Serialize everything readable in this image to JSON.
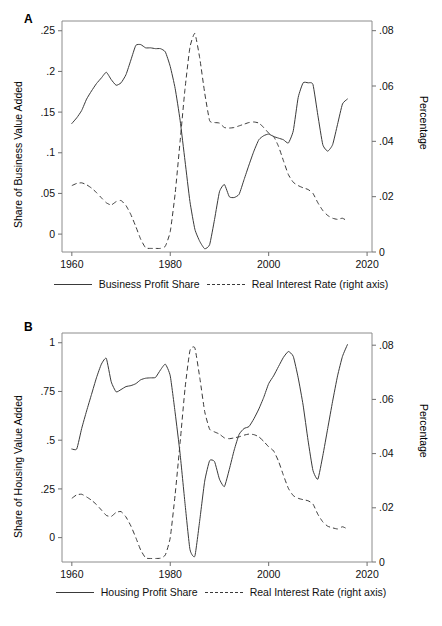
{
  "figure": {
    "caption": ""
  },
  "chart_data": [
    {
      "type": "line",
      "panel": "A",
      "panel_label": "A",
      "title": "",
      "xlabel": "",
      "ylabel": "Share of Business Value Added",
      "y2label": "Percentage",
      "xlim": [
        1958,
        2021
      ],
      "ylim": [
        -0.022,
        0.262
      ],
      "y2lim": [
        0.0,
        0.0835
      ],
      "xticks": [
        1960,
        1980,
        2000,
        2020
      ],
      "xticklabels": [
        "1960",
        "1980",
        "2000",
        "2020"
      ],
      "yticks": [
        0,
        0.05,
        0.1,
        0.15,
        0.2,
        0.25
      ],
      "yticklabels": [
        "0",
        ".05",
        ".1",
        ".15",
        ".2",
        ".25"
      ],
      "y2ticks": [
        0,
        0.02,
        0.04,
        0.06,
        0.08
      ],
      "y2ticklabels": [
        "0",
        ".02",
        ".04",
        ".06",
        ".08"
      ],
      "grid": false,
      "legend_position": "below",
      "series": [
        {
          "name": "Business Profit Share",
          "style": "solid",
          "axis": "left",
          "x": [
            1960,
            1961,
            1962,
            1963,
            1964,
            1965,
            1966,
            1967,
            1968,
            1969,
            1970,
            1971,
            1972,
            1973,
            1974,
            1975,
            1976,
            1977,
            1978,
            1979,
            1980,
            1981,
            1982,
            1983,
            1984,
            1985,
            1986,
            1987,
            1988,
            1989,
            1990,
            1991,
            1992,
            1993,
            1994,
            1995,
            1996,
            1997,
            1998,
            1999,
            2000,
            2001,
            2002,
            2003,
            2004,
            2005,
            2006,
            2007,
            2008,
            2009,
            2010,
            2011,
            2012,
            2013,
            2014,
            2015,
            2016
          ],
          "y": [
            0.136,
            0.143,
            0.152,
            0.166,
            0.176,
            0.185,
            0.192,
            0.199,
            0.19,
            0.183,
            0.186,
            0.196,
            0.214,
            0.232,
            0.233,
            0.229,
            0.229,
            0.228,
            0.228,
            0.224,
            0.206,
            0.179,
            0.14,
            0.09,
            0.04,
            0.006,
            -0.009,
            -0.018,
            -0.013,
            0.018,
            0.052,
            0.061,
            0.046,
            0.045,
            0.049,
            0.067,
            0.085,
            0.102,
            0.116,
            0.121,
            0.123,
            0.12,
            0.118,
            0.116,
            0.112,
            0.127,
            0.168,
            0.186,
            0.186,
            0.184,
            0.146,
            0.11,
            0.102,
            0.11,
            0.135,
            0.16,
            0.166
          ]
        },
        {
          "name": "Real Interest Rate (right axis)",
          "style": "dashed",
          "axis": "right",
          "x": [
            1960,
            1961,
            1962,
            1963,
            1964,
            1965,
            1966,
            1967,
            1968,
            1969,
            1970,
            1971,
            1972,
            1973,
            1974,
            1975,
            1976,
            1977,
            1978,
            1979,
            1980,
            1981,
            1982,
            1983,
            1984,
            1985,
            1986,
            1987,
            1988,
            1989,
            1990,
            1991,
            1992,
            1993,
            1994,
            1995,
            1996,
            1997,
            1998,
            1999,
            2000,
            2001,
            2002,
            2003,
            2004,
            2005,
            2006,
            2007,
            2008,
            2009,
            2010,
            2011,
            2012,
            2013,
            2014,
            2015,
            2016
          ],
          "y": [
            0.024,
            0.0248,
            0.025,
            0.0243,
            0.0231,
            0.0215,
            0.0196,
            0.0178,
            0.017,
            0.0182,
            0.0186,
            0.0168,
            0.0135,
            0.0092,
            0.0046,
            0.0015,
            0.0013,
            0.0013,
            0.0013,
            0.0021,
            0.0074,
            0.0212,
            0.04,
            0.059,
            0.074,
            0.079,
            0.07,
            0.0575,
            0.0475,
            0.0468,
            0.0466,
            0.045,
            0.0448,
            0.045,
            0.0456,
            0.0462,
            0.0468,
            0.047,
            0.0466,
            0.045,
            0.043,
            0.0418,
            0.0382,
            0.033,
            0.028,
            0.0252,
            0.024,
            0.0232,
            0.0226,
            0.0212,
            0.0178,
            0.015,
            0.0132,
            0.0122,
            0.0118,
            0.0122,
            0.0112
          ]
        }
      ]
    },
    {
      "type": "line",
      "panel": "B",
      "panel_label": "B",
      "title": "",
      "xlabel": "",
      "ylabel": "Share of Housing Value Added",
      "y2label": "Percentage",
      "xlim": [
        1958,
        2021
      ],
      "ylim": [
        -0.125,
        1.05
      ],
      "y2lim": [
        0.0,
        0.0845
      ],
      "xticks": [
        1960,
        1980,
        2000,
        2020
      ],
      "xticklabels": [
        "1960",
        "1980",
        "2000",
        "2020"
      ],
      "yticks": [
        0,
        0.25,
        0.5,
        0.75,
        1
      ],
      "yticklabels": [
        "0",
        ".25",
        ".5",
        ".75",
        "1"
      ],
      "y2ticks": [
        0,
        0.02,
        0.04,
        0.06,
        0.08
      ],
      "y2ticklabels": [
        "0",
        ".02",
        ".04",
        ".06",
        ".08"
      ],
      "grid": false,
      "legend_position": "below",
      "series": [
        {
          "name": "Housing Profit Share",
          "style": "solid",
          "axis": "left",
          "x": [
            1960,
            1961,
            1962,
            1963,
            1964,
            1965,
            1966,
            1967,
            1968,
            1969,
            1970,
            1971,
            1972,
            1973,
            1974,
            1975,
            1976,
            1977,
            1978,
            1979,
            1980,
            1981,
            1982,
            1983,
            1984,
            1985,
            1986,
            1987,
            1988,
            1989,
            1990,
            1991,
            1992,
            1993,
            1994,
            1995,
            1996,
            1997,
            1998,
            1999,
            2000,
            2001,
            2002,
            2003,
            2004,
            2005,
            2006,
            2007,
            2008,
            2009,
            2010,
            2011,
            2012,
            2013,
            2014,
            2015,
            2016
          ],
          "y": [
            0.455,
            0.455,
            0.56,
            0.65,
            0.735,
            0.82,
            0.89,
            0.92,
            0.8,
            0.748,
            0.76,
            0.775,
            0.78,
            0.79,
            0.81,
            0.818,
            0.82,
            0.822,
            0.86,
            0.89,
            0.83,
            0.64,
            0.43,
            0.175,
            -0.06,
            -0.095,
            0.09,
            0.29,
            0.395,
            0.39,
            0.3,
            0.262,
            0.35,
            0.45,
            0.53,
            0.56,
            0.57,
            0.61,
            0.66,
            0.72,
            0.79,
            0.83,
            0.878,
            0.925,
            0.955,
            0.93,
            0.82,
            0.68,
            0.5,
            0.345,
            0.3,
            0.42,
            0.56,
            0.7,
            0.83,
            0.93,
            0.99
          ]
        },
        {
          "name": "Real Interest Rate (right axis)",
          "style": "dashed",
          "axis": "right",
          "x": [
            1960,
            1961,
            1962,
            1963,
            1964,
            1965,
            1966,
            1967,
            1968,
            1969,
            1970,
            1971,
            1972,
            1973,
            1974,
            1975,
            1976,
            1977,
            1978,
            1979,
            1980,
            1981,
            1982,
            1983,
            1984,
            1985,
            1986,
            1987,
            1988,
            1989,
            1990,
            1991,
            1992,
            1993,
            1994,
            1995,
            1996,
            1997,
            1998,
            1999,
            2000,
            2001,
            2002,
            2003,
            2004,
            2005,
            2006,
            2007,
            2008,
            2009,
            2010,
            2011,
            2012,
            2013,
            2014,
            2015,
            2016
          ],
          "y": [
            0.0235,
            0.0248,
            0.025,
            0.024,
            0.0228,
            0.0212,
            0.0192,
            0.0172,
            0.0168,
            0.0183,
            0.0186,
            0.0166,
            0.0133,
            0.009,
            0.0044,
            0.0015,
            0.0013,
            0.0013,
            0.0014,
            0.0026,
            0.009,
            0.025,
            0.044,
            0.064,
            0.078,
            0.079,
            0.068,
            0.0555,
            0.049,
            0.048,
            0.0472,
            0.0458,
            0.0455,
            0.0458,
            0.0462,
            0.0468,
            0.0472,
            0.047,
            0.0462,
            0.0445,
            0.0425,
            0.041,
            0.0372,
            0.032,
            0.0272,
            0.0245,
            0.0235,
            0.023,
            0.0226,
            0.0214,
            0.0176,
            0.0148,
            0.0132,
            0.0126,
            0.0122,
            0.013,
            0.0122
          ]
        }
      ]
    }
  ],
  "panel_a": {
    "letter": "A",
    "ylabel": "Share of Business Value Added",
    "y2label": "Percentage",
    "legend": {
      "solid_label": "Business Profit Share",
      "dashed_label": "Real Interest Rate (right axis)"
    }
  },
  "panel_b": {
    "letter": "B",
    "ylabel": "Share of Housing Value Added",
    "y2label": "Percentage",
    "legend": {
      "solid_label": "Housing Profit Share",
      "dashed_label": "Real Interest Rate (right axis)"
    }
  }
}
